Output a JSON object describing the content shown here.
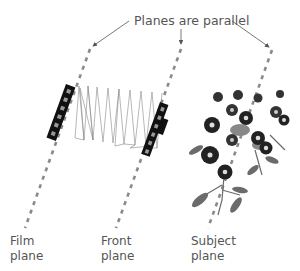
{
  "title": "Planes are parallel",
  "labels": {
    "film": {
      "line1": "Film",
      "line2": "plane"
    },
    "front": {
      "line1": "Front",
      "line2": "plane"
    },
    "subject": {
      "line1": "Subject",
      "line2": "plane"
    }
  },
  "colors": {
    "text": "#555555",
    "dashed_line": "#8a8a8a",
    "arrow": "#555555",
    "standard_body": "#111111",
    "bellows": "#888888",
    "flower_dark": "#222222",
    "leaf": "#6b6b6b"
  }
}
